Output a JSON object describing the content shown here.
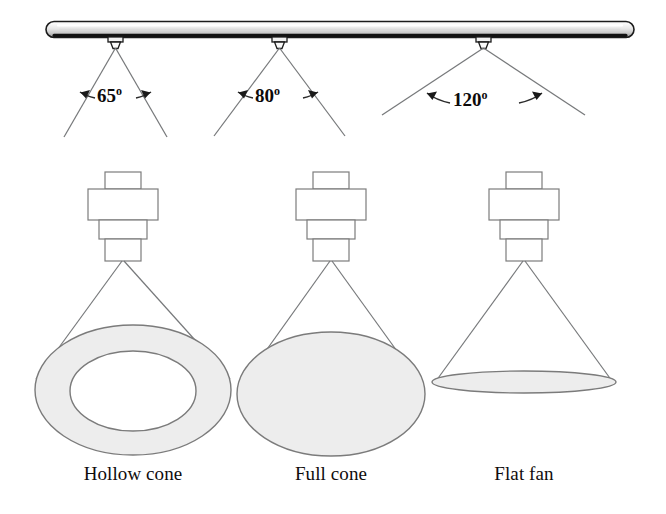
{
  "figure": {
    "background_color": "#ffffff",
    "line_color": "#6d6d6d",
    "dark_line_color": "#1a1a1a",
    "fill_color": "#ededed",
    "text_color": "#100c0c"
  },
  "header": {
    "manifold_name": "spray header pipe",
    "nozzle_count": 3
  },
  "spray_angles": [
    {
      "value": "65",
      "degree_symbol": "o",
      "label": "65o"
    },
    {
      "value": "80",
      "degree_symbol": "o",
      "label": "80o"
    },
    {
      "value": "120",
      "degree_symbol": "o",
      "label": "120o"
    }
  ],
  "patterns": [
    {
      "label": "Hollow cone",
      "shape": "annulus"
    },
    {
      "label": "Full cone",
      "shape": "ellipse"
    },
    {
      "label": "Flat fan",
      "shape": "thin-ellipse"
    }
  ]
}
